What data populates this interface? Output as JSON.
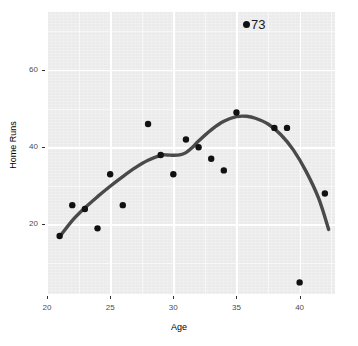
{
  "chart_data": {
    "type": "scatter",
    "title": "",
    "xlabel": "Age",
    "ylabel": "Home Runs",
    "xlim": [
      20.0,
      42.8
    ],
    "ylim": [
      2.0,
      75.0
    ],
    "xticks": [
      20,
      25,
      30,
      35,
      40
    ],
    "xtick_labels": [
      "20",
      "25",
      "30",
      "35",
      "40"
    ],
    "yticks": [
      20,
      40,
      60
    ],
    "ytick_labels": [
      "20",
      "40",
      "60"
    ],
    "grid": true,
    "legend": false,
    "panel_background": "#ebebeb",
    "grid_color": "#ffffff",
    "point_color": "#111111",
    "line_color": "#4a4a4a",
    "series": [
      {
        "name": "Home Runs by Age",
        "kind": "scatter",
        "x": [
          21,
          22,
          23,
          24,
          25,
          26,
          28,
          29,
          30,
          31,
          32,
          33,
          34,
          35,
          38,
          39,
          40,
          42
        ],
        "y": [
          17,
          25,
          24,
          19,
          33,
          25,
          46,
          38,
          33,
          42,
          40,
          37,
          34,
          49,
          45,
          45,
          5,
          28
        ]
      },
      {
        "name": "Smoothed trend",
        "kind": "line",
        "x": [
          21.0,
          22.0,
          23.0,
          24.0,
          25.0,
          26.0,
          27.0,
          28.0,
          29.0,
          29.5,
          30.0,
          30.5,
          31.0,
          31.5,
          32.0,
          33.0,
          34.0,
          35.0,
          35.8,
          36.5,
          37.5,
          38.5,
          39.5,
          40.5,
          41.5,
          42.3
        ],
        "y": [
          16.8,
          21.0,
          24.3,
          27.2,
          29.9,
          32.4,
          34.7,
          36.6,
          37.9,
          38.0,
          37.9,
          38.0,
          38.6,
          39.9,
          41.6,
          44.5,
          46.7,
          47.9,
          48.0,
          47.5,
          46.0,
          43.3,
          39.3,
          33.8,
          26.8,
          18.7
        ]
      }
    ],
    "annotations": [
      {
        "name": "outlier-callout",
        "label": "73",
        "marker": "filled-circle",
        "x_px": 247,
        "y_px": 25
      }
    ]
  },
  "axis": {
    "x_title": "Age",
    "y_title": "Home Runs"
  }
}
